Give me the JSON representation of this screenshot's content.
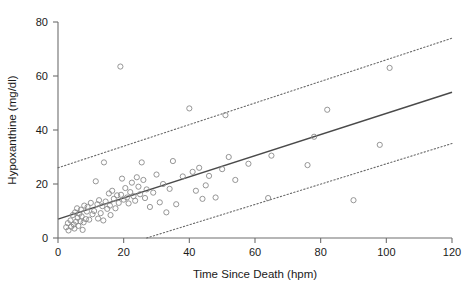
{
  "chart_data": {
    "type": "scatter",
    "title": "",
    "xlabel": "Time Since Death (hpm)",
    "ylabel": "Hypoxanthine (mg/dl)",
    "xlim": [
      0,
      120
    ],
    "ylim": [
      0,
      80
    ],
    "xticks": [
      0,
      20,
      40,
      60,
      80,
      100,
      120
    ],
    "yticks": [
      0,
      20,
      40,
      60,
      80
    ],
    "xtick_labels": [
      "0",
      "20",
      "40",
      "60",
      "80",
      "100",
      "120"
    ],
    "ytick_labels": [
      "0",
      "20",
      "40",
      "60",
      "80"
    ],
    "grid": false,
    "legend": null,
    "marker": "open-circle",
    "marker_color": "#8a8a8a",
    "line_color": "#4a4a4a",
    "series": [
      {
        "name": "Hypoxanthine measurements",
        "type": "scatter",
        "points": [
          [
            2.5,
            4.0
          ],
          [
            3.0,
            5.5
          ],
          [
            3.2,
            2.8
          ],
          [
            3.8,
            6.5
          ],
          [
            4.0,
            4.2
          ],
          [
            4.5,
            8.5
          ],
          [
            4.8,
            5.0
          ],
          [
            5.0,
            3.5
          ],
          [
            5.2,
            9.5
          ],
          [
            5.5,
            6.0
          ],
          [
            5.8,
            11.0
          ],
          [
            6.0,
            7.5
          ],
          [
            6.2,
            4.5
          ],
          [
            6.5,
            9.0
          ],
          [
            6.8,
            6.2
          ],
          [
            7.0,
            10.5
          ],
          [
            7.2,
            8.0
          ],
          [
            7.5,
            3.0
          ],
          [
            7.8,
            5.8
          ],
          [
            8.0,
            12.0
          ],
          [
            8.5,
            7.0
          ],
          [
            8.8,
            9.8
          ],
          [
            9.0,
            11.5
          ],
          [
            9.5,
            6.8
          ],
          [
            10.0,
            13.0
          ],
          [
            10.5,
            8.8
          ],
          [
            11.0,
            10.0
          ],
          [
            11.5,
            21.0
          ],
          [
            12.0,
            12.5
          ],
          [
            12.2,
            7.2
          ],
          [
            12.5,
            14.0
          ],
          [
            13.0,
            9.2
          ],
          [
            13.5,
            11.8
          ],
          [
            13.8,
            6.5
          ],
          [
            14.0,
            28.0
          ],
          [
            14.5,
            13.5
          ],
          [
            15.0,
            10.8
          ],
          [
            15.5,
            16.5
          ],
          [
            15.8,
            12.0
          ],
          [
            16.0,
            8.5
          ],
          [
            16.5,
            17.5
          ],
          [
            17.0,
            14.5
          ],
          [
            17.5,
            11.0
          ],
          [
            18.0,
            15.8
          ],
          [
            18.5,
            13.0
          ],
          [
            19.0,
            63.5
          ],
          [
            19.2,
            16.0
          ],
          [
            19.5,
            22.0
          ],
          [
            20.0,
            14.2
          ],
          [
            20.5,
            18.5
          ],
          [
            21.0,
            15.0
          ],
          [
            21.5,
            12.8
          ],
          [
            22.0,
            17.0
          ],
          [
            22.5,
            20.5
          ],
          [
            23.0,
            15.5
          ],
          [
            23.5,
            13.8
          ],
          [
            24.0,
            22.5
          ],
          [
            24.5,
            19.0
          ],
          [
            25.0,
            16.2
          ],
          [
            25.5,
            28.0
          ],
          [
            26.0,
            21.5
          ],
          [
            26.5,
            14.8
          ],
          [
            27.0,
            18.0
          ],
          [
            28.0,
            11.5
          ],
          [
            29.0,
            16.8
          ],
          [
            30.0,
            23.5
          ],
          [
            31.0,
            13.2
          ],
          [
            32.0,
            20.0
          ],
          [
            33.0,
            9.5
          ],
          [
            34.0,
            18.2
          ],
          [
            35.0,
            28.5
          ],
          [
            36.0,
            12.5
          ],
          [
            38.0,
            22.8
          ],
          [
            40.0,
            48.0
          ],
          [
            41.0,
            24.5
          ],
          [
            42.0,
            17.5
          ],
          [
            43.0,
            26.0
          ],
          [
            44.0,
            14.5
          ],
          [
            45.0,
            19.5
          ],
          [
            46.0,
            23.0
          ],
          [
            48.0,
            15.0
          ],
          [
            50.0,
            25.5
          ],
          [
            51.0,
            45.5
          ],
          [
            52.0,
            30.0
          ],
          [
            54.0,
            21.5
          ],
          [
            58.0,
            27.5
          ],
          [
            64.0,
            14.8
          ],
          [
            65.0,
            30.5
          ],
          [
            76.0,
            27.0
          ],
          [
            78.0,
            37.5
          ],
          [
            82.0,
            47.5
          ],
          [
            90.0,
            14.0
          ],
          [
            98.0,
            34.5
          ],
          [
            101.0,
            63.0
          ]
        ]
      },
      {
        "name": "Regression line",
        "type": "line",
        "style": "solid",
        "endpoints": [
          [
            0,
            7.0
          ],
          [
            120,
            54.0
          ]
        ]
      },
      {
        "name": "Upper prediction interval",
        "type": "line",
        "style": "dotted",
        "endpoints": [
          [
            0,
            26.0
          ],
          [
            120,
            74.0
          ]
        ]
      },
      {
        "name": "Lower prediction interval",
        "type": "line",
        "style": "dotted",
        "endpoints": [
          [
            27,
            0.0
          ],
          [
            120,
            35.0
          ]
        ]
      }
    ]
  }
}
